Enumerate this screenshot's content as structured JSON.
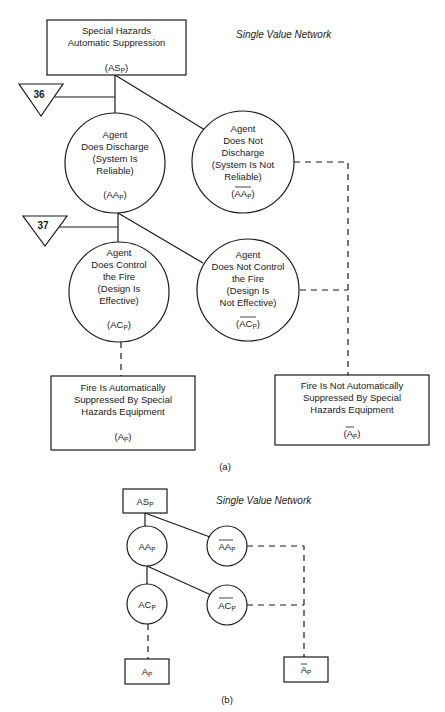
{
  "diagram_a": {
    "network_label": "Single Value Network",
    "caption": "(a)",
    "root": {
      "lines": [
        "Special Hazards",
        "Automatic Suppression"
      ],
      "symbol": "AS",
      "sub": "P"
    },
    "tri_36": "36",
    "tri_37": "37",
    "aa": {
      "lines": [
        "Agent",
        "Does Discharge",
        "(System Is",
        "Reliable)"
      ],
      "symbol": "AA",
      "sub": "P"
    },
    "aa_not": {
      "lines": [
        "Agent",
        "Does Not",
        "Discharge",
        "(System Is Not",
        "Reliable)"
      ],
      "symbol": "AA",
      "sub": "P"
    },
    "ac": {
      "lines": [
        "Agent",
        "Does Control",
        "the Fire",
        "(Design Is",
        "Effective)"
      ],
      "symbol": "AC",
      "sub": "P"
    },
    "ac_not": {
      "lines": [
        "Agent",
        "Does Not Control",
        "the Fire",
        "(Design Is",
        "Not Effective)"
      ],
      "symbol": "AC",
      "sub": "P"
    },
    "outcome_success": {
      "lines": [
        "Fire Is Automatically",
        "Suppressed By Special",
        "Hazards Equipment"
      ],
      "symbol": "A",
      "sub": "P"
    },
    "outcome_fail": {
      "lines": [
        "Fire Is Not Automatically",
        "Suppressed By Special",
        "Hazards Equipment"
      ],
      "symbol": "A",
      "sub": "P"
    }
  },
  "diagram_b": {
    "network_label": "Single Value Network",
    "caption": "(b)",
    "root": {
      "symbol": "AS",
      "sub": "P"
    },
    "aa": {
      "symbol": "AA",
      "sub": "P"
    },
    "aa_not": {
      "symbol": "AA",
      "sub": "P"
    },
    "ac": {
      "symbol": "AC",
      "sub": "P"
    },
    "ac_not": {
      "symbol": "AC",
      "sub": "P"
    },
    "outcome_success": {
      "symbol": "A",
      "sub": "P"
    },
    "outcome_fail": {
      "symbol": "A",
      "sub": "P"
    }
  }
}
